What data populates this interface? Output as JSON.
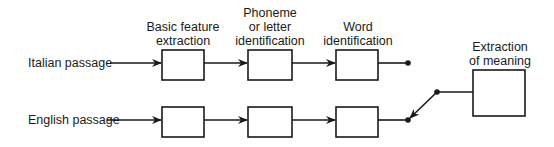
{
  "diagram": {
    "stage_labels": {
      "basic_feature": [
        "Basic feature",
        "extraction"
      ],
      "phoneme": [
        "Phoneme",
        "or letter",
        "identification"
      ],
      "word": [
        "Word",
        "identification"
      ],
      "meaning": [
        "Extraction",
        "of meaning"
      ]
    },
    "inputs": {
      "italian": "Italian passage",
      "english": "English passage"
    },
    "switch_state": "connected to English passage",
    "line_color": "#1a1a1a"
  }
}
